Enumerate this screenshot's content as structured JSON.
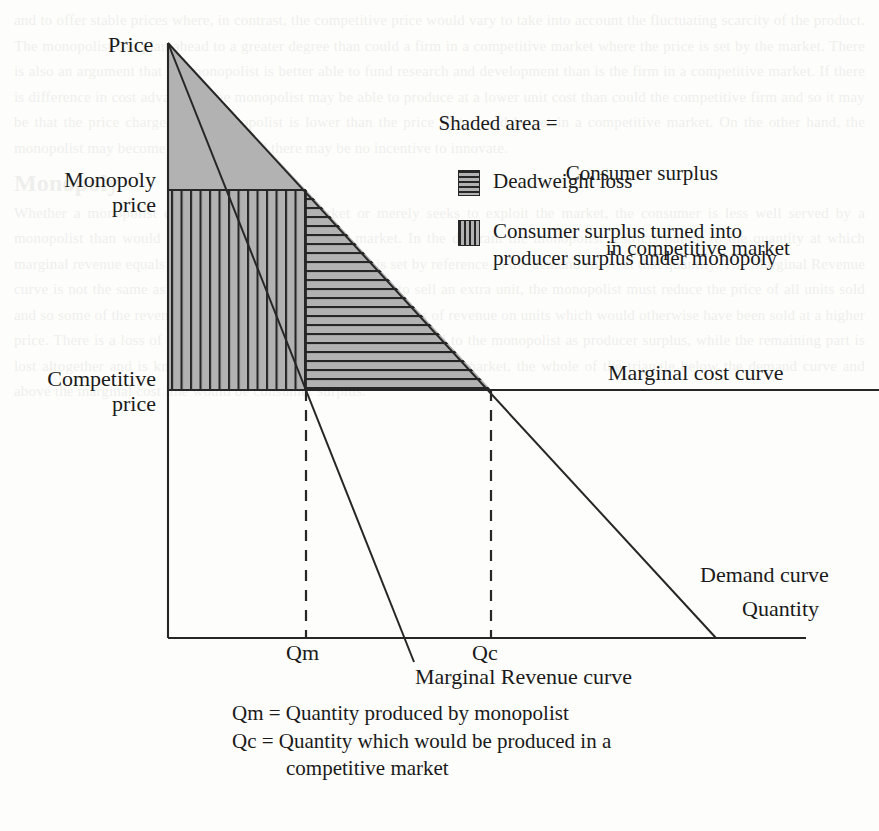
{
  "axes": {
    "price_label": "Price",
    "quantity_label": "Quantity"
  },
  "price_levels": {
    "monopoly": "Monopoly\nprice",
    "competitive": "Competitive\nprice"
  },
  "curves": {
    "marginal_cost": "Marginal cost curve",
    "demand": "Demand curve",
    "marginal_revenue": "Marginal Revenue curve"
  },
  "ticks": {
    "qm": "Qm",
    "qc": "Qc"
  },
  "legend": {
    "shaded_area_prefix": "Shaded area =",
    "shaded_area_line1": "Consumer surplus",
    "shaded_area_line2": "in competitive market",
    "deadweight_loss": "Deadweight loss",
    "consumer_surplus_line1": "Consumer surplus turned into",
    "consumer_surplus_line2": "producer surplus under monopoly"
  },
  "definitions": {
    "qm_def": "Qm = Quantity produced by monopolist",
    "qc_def_line1": "Qc = Quantity which would be produced in a",
    "qc_def_line2": "competitive market"
  },
  "colors": {
    "shade_gray": "#b2b2b2",
    "line_dark": "#262626",
    "page_background": "#fdfdfb"
  },
  "chart_data": {
    "type": "line",
    "xlabel": "Quantity",
    "ylabel": "Price",
    "xlim": [
      0,
      100
    ],
    "ylim": [
      0,
      100
    ],
    "grid": false,
    "legend_position": "upper-right",
    "series": [
      {
        "name": "Demand curve",
        "type": "line",
        "x": [
          0,
          100
        ],
        "y": [
          100,
          0
        ]
      },
      {
        "name": "Marginal Revenue curve",
        "type": "line",
        "x": [
          0,
          50
        ],
        "y": [
          100,
          0
        ]
      },
      {
        "name": "Marginal cost curve",
        "type": "line",
        "x": [
          0,
          100
        ],
        "y": [
          41,
          41
        ]
      }
    ],
    "annotations": [
      {
        "label": "Monopoly price",
        "axis": "y",
        "value": 74
      },
      {
        "label": "Competitive price",
        "axis": "y",
        "value": 41
      },
      {
        "label": "Qm",
        "axis": "x",
        "value": 26
      },
      {
        "label": "Qc",
        "axis": "x",
        "value": 59
      }
    ],
    "regions": [
      {
        "name": "Consumer surplus under monopoly",
        "fill": "solid-gray",
        "vertices": [
          [
            0,
            100
          ],
          [
            0,
            74
          ],
          [
            26,
            74
          ]
        ]
      },
      {
        "name": "Consumer surplus turned into producer surplus under monopoly",
        "fill": "vertical-stripes",
        "vertices": [
          [
            0,
            74
          ],
          [
            0,
            41
          ],
          [
            26,
            41
          ],
          [
            26,
            74
          ]
        ]
      },
      {
        "name": "Deadweight loss",
        "fill": "horizontal-stripes",
        "vertices": [
          [
            26,
            74
          ],
          [
            26,
            41
          ],
          [
            59,
            41
          ]
        ]
      }
    ]
  },
  "ghost_text": {
    "right_column": "and to offer stable prices where, in contrast, the competitive price would vary to take into account the fluctuating scarcity of the product. The monopolist can plan ahead to a greater degree than could a firm in a competitive market where the price is set by the market. There is also an argument that the monopolist is better able to fund research and development than is the firm in a competitive market. If there is difference in cost advantage, the monopolist may be able to produce at a lower unit cost than could the competitive firm and so it may be that the price charged by a monopolist is lower than the price that would be set in a competitive market. On the other hand, the monopolist may become complacent and there may be no incentive to innovate.",
    "heading": "Monopoly",
    "lower_column": "Whether a monopolist does not react to the market or merely seeks to exploit the market, the consumer is less well served by a monopolist than would be the case in a competitive market. In the diagram the monopolist restricts output to the quantity at which marginal revenue equals marginal cost. The price charged is set by reference to the demand curve at that quantity. The Marginal Revenue curve is not the same as the demand curve because, in order to sell an extra unit, the monopolist must reduce the price of all units sold and so some of the revenue from the extra unit is offset by the loss of revenue on units which would otherwise have been sold at a higher price. There is a loss of consumer surplus which is partly transferred to the monopolist as producer surplus, while the remaining part is lost altogether and is known as the deadweight loss. In a competitive market, the whole of the triangle below the demand curve and above the marginal cost line would be consumer surplus."
  }
}
